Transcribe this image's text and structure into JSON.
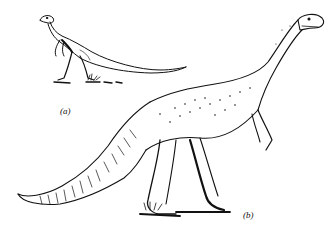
{
  "figure": {
    "labels": {
      "a": "(a)",
      "b": "(b)"
    },
    "colors": {
      "ink": "#111111",
      "background": "#ffffff"
    }
  }
}
